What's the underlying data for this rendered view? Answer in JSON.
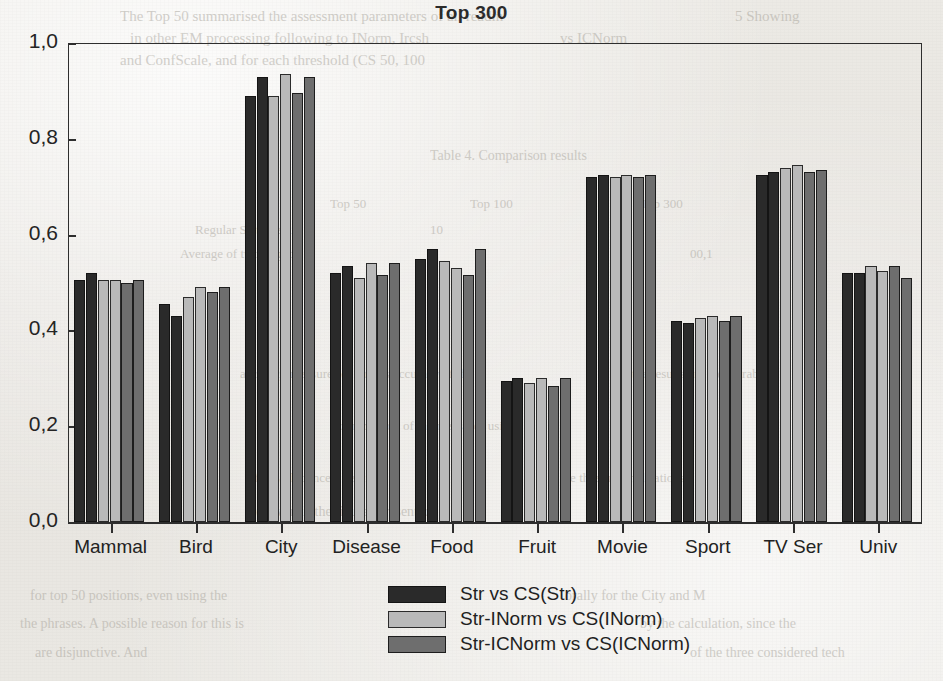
{
  "chart_data": {
    "type": "bar",
    "title": "Top 300",
    "xlabel": "",
    "ylabel": "",
    "ylim": [
      0.0,
      1.0
    ],
    "ytick_labels": [
      "0,0",
      "0,2",
      "0,4",
      "0,6",
      "0,8",
      "1,0"
    ],
    "ytick_values": [
      0.0,
      0.2,
      0.4,
      0.6,
      0.8,
      1.0
    ],
    "grid": false,
    "legend_position": "bottom-center",
    "decimal_separator": ",",
    "bars_per_group": 6,
    "categories": [
      "Mammal",
      "Bird",
      "City",
      "Disease",
      "Food",
      "Fruit",
      "Movie",
      "Sport",
      "TV Ser",
      "Univ"
    ],
    "series": [
      {
        "name": "Str vs CS(Str)",
        "color": "#2a2a2a",
        "values": [
          0.505,
          0.455,
          0.89,
          0.52,
          0.55,
          0.295,
          0.72,
          0.42,
          0.725,
          0.52
        ],
        "values_b": [
          0.52,
          0.43,
          0.93,
          0.535,
          0.57,
          0.3,
          0.725,
          0.415,
          0.73,
          0.52
        ]
      },
      {
        "name": "Str-INorm  vs CS(INorm)",
        "color": "#b9b9b9",
        "values": [
          0.505,
          0.47,
          0.89,
          0.51,
          0.545,
          0.29,
          0.72,
          0.425,
          0.74,
          0.535
        ],
        "values_b": [
          0.505,
          0.49,
          0.935,
          0.54,
          0.53,
          0.3,
          0.725,
          0.43,
          0.745,
          0.525
        ]
      },
      {
        "name": "Str-ICNorm  vs CS(ICNorm)",
        "color": "#6e6e6e",
        "values": [
          0.5,
          0.48,
          0.895,
          0.515,
          0.515,
          0.285,
          0.72,
          0.42,
          0.73,
          0.535
        ],
        "values_b": [
          0.505,
          0.49,
          0.93,
          0.54,
          0.57,
          0.3,
          0.725,
          0.43,
          0.735,
          0.51
        ]
      }
    ],
    "legend_entries": [
      {
        "label": "Str vs CS(Str)",
        "color": "#2a2a2a"
      },
      {
        "label": "Str-INorm  vs CS(INorm)",
        "color": "#b9b9b9"
      },
      {
        "label": "Str-ICNorm  vs CS(ICNorm)",
        "color": "#6e6e6e"
      }
    ]
  },
  "bleed_text": [
    {
      "text": "The Top 50 summarised the assessment parameters of all readin",
      "x": 120,
      "y": 8,
      "size": 15,
      "mirror": false
    },
    {
      "text": "5 Showing",
      "x": 735,
      "y": 8,
      "size": 15,
      "mirror": false
    },
    {
      "text": "in other EM processing following to INorm, Ircsh",
      "x": 130,
      "y": 30,
      "size": 15,
      "mirror": false
    },
    {
      "text": "vs ICNorm",
      "x": 560,
      "y": 30,
      "size": 15,
      "mirror": false
    },
    {
      "text": "and ConfScale, and for each threshold (CS 50, 100",
      "x": 120,
      "y": 52,
      "size": 15,
      "mirror": false
    },
    {
      "text": "Table 4. Comparison results",
      "x": 430,
      "y": 148,
      "size": 14,
      "mirror": false
    },
    {
      "text": "Top 50",
      "x": 330,
      "y": 196,
      "size": 13,
      "mirror": false
    },
    {
      "text": "Top 100",
      "x": 470,
      "y": 196,
      "size": 13,
      "mirror": false
    },
    {
      "text": "Top 300",
      "x": 640,
      "y": 196,
      "size": 13,
      "mirror": false
    },
    {
      "text": "Regular Statement",
      "x": 195,
      "y": 222,
      "size": 13,
      "mirror": false
    },
    {
      "text": "10",
      "x": 430,
      "y": 222,
      "size": 13,
      "mirror": false
    },
    {
      "text": "Average of two avg. of",
      "x": 180,
      "y": 246,
      "size": 13,
      "mirror": false
    },
    {
      "text": "00,1",
      "x": 690,
      "y": 246,
      "size": 13,
      "mirror": false
    },
    {
      "text": "4",
      "x": 265,
      "y": 310,
      "size": 13,
      "mirror": false
    },
    {
      "text": "accuracy measures of corpus accuracy of the",
      "x": 240,
      "y": 366,
      "size": 13,
      "mirror": false
    },
    {
      "text": "and the results are comparable",
      "x": 610,
      "y": 366,
      "size": 13,
      "mirror": false
    },
    {
      "text": "a comparison of the measures using",
      "x": 330,
      "y": 418,
      "size": 13,
      "mirror": false
    },
    {
      "text": "for each concept set in",
      "x": 255,
      "y": 470,
      "size": 13,
      "mirror": false
    },
    {
      "text": "the three normalisations",
      "x": 560,
      "y": 470,
      "size": 13,
      "mirror": false
    },
    {
      "text": "are given in the figures presented",
      "x": 245,
      "y": 504,
      "size": 14,
      "mirror": false
    },
    {
      "text": "for top 50 positions, even using the",
      "x": 30,
      "y": 588,
      "size": 14,
      "mirror": false
    },
    {
      "text": "orally for the City and M",
      "x": 565,
      "y": 588,
      "size": 14,
      "mirror": false
    },
    {
      "text": "the phrases. A possible reason for this is",
      "x": 20,
      "y": 616,
      "size": 14,
      "mirror": false
    },
    {
      "text": "by the calculation, since the",
      "x": 640,
      "y": 616,
      "size": 14,
      "mirror": false
    },
    {
      "text": "are disjunctive. And",
      "x": 35,
      "y": 645,
      "size": 14,
      "mirror": false
    },
    {
      "text": "of the three considered tech",
      "x": 690,
      "y": 645,
      "size": 14,
      "mirror": false
    }
  ]
}
